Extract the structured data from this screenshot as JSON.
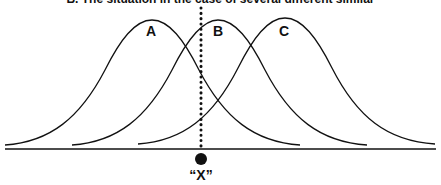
{
  "title": "B. The situation in the case of several different similar",
  "curves": [
    {
      "label": "A",
      "peak_x": 152,
      "peak_y": 20,
      "start_x": 5,
      "end_x": 300
    },
    {
      "label": "B",
      "peak_x": 218,
      "peak_y": 20,
      "start_x": 72,
      "end_x": 367
    },
    {
      "label": "C",
      "peak_x": 285,
      "peak_y": 18,
      "start_x": 138,
      "end_x": 435
    }
  ],
  "marker": {
    "label": "“X”",
    "x": 201
  },
  "colors": {
    "stroke": "#111111",
    "background": "#ffffff"
  }
}
